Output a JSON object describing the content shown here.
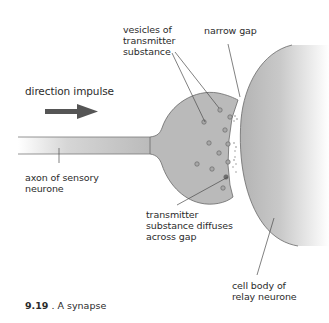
{
  "labels": {
    "vesicles": "vesicles of\ntransmitter\nsubstance",
    "narrow_gap": "narrow gap",
    "direction": "direction impulse",
    "axon": "axon of sensory\nneurone",
    "diffuses": "transmitter\nsubstance diffuses\nacross gap",
    "cell_body": "cell body of\nrelay neurone"
  },
  "caption": {
    "number": "9.19",
    "text": " . A synapse"
  },
  "colors": {
    "membrane_fill": "#b9b9b9",
    "outline": "#6d6d6d",
    "arrow": "#555555",
    "text": "#2b2b2b",
    "background": "#ffffff"
  }
}
